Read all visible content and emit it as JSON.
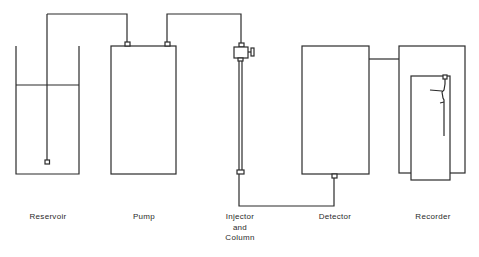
{
  "diagram": {
    "type": "HPLC system schematic",
    "components": [
      {
        "id": "reservoir",
        "label": "Reservoir"
      },
      {
        "id": "pump",
        "label": "Pump"
      },
      {
        "id": "injector-column",
        "label_lines": [
          "Injector",
          "and",
          "Column"
        ]
      },
      {
        "id": "detector",
        "label": "Detector"
      },
      {
        "id": "recorder",
        "label": "Recorder"
      }
    ],
    "connections": [
      {
        "from": "reservoir",
        "to": "pump"
      },
      {
        "from": "pump",
        "to": "injector-column"
      },
      {
        "from": "injector-column",
        "to": "detector"
      },
      {
        "from": "detector",
        "to": "recorder"
      }
    ],
    "colors": {
      "line": "#2b2b2b",
      "background": "#ffffff",
      "text": "#2a2a2a"
    }
  }
}
